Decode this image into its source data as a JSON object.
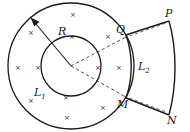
{
  "figure": {
    "stroke_color": "#1a1a1a",
    "field_symbol": "×",
    "field_direction": "into-page"
  },
  "labels": {
    "radius": "R",
    "loop_inner": "L",
    "loop_inner_sub": "1",
    "loop_outer": "L",
    "loop_outer_sub": "2",
    "vertex_p": "P",
    "vertex_q": "Q",
    "vertex_m": "M",
    "vertex_n": "N"
  },
  "geometry": {
    "center_x": 71,
    "center_y": 66,
    "outer_radius": 63,
    "inner_radius": 30,
    "arrow_tip_x": 31,
    "arrow_tip_y": 18
  },
  "field_marks": [
    {
      "x": 73,
      "y": 15
    },
    {
      "x": 31,
      "y": 33
    },
    {
      "x": 72,
      "y": 37
    },
    {
      "x": 108,
      "y": 37
    },
    {
      "x": 18,
      "y": 68
    },
    {
      "x": 38,
      "y": 68
    },
    {
      "x": 98,
      "y": 68
    },
    {
      "x": 119,
      "y": 68
    },
    {
      "x": 31,
      "y": 101
    },
    {
      "x": 66,
      "y": 98
    },
    {
      "x": 103,
      "y": 108
    },
    {
      "x": 67,
      "y": 118
    }
  ]
}
